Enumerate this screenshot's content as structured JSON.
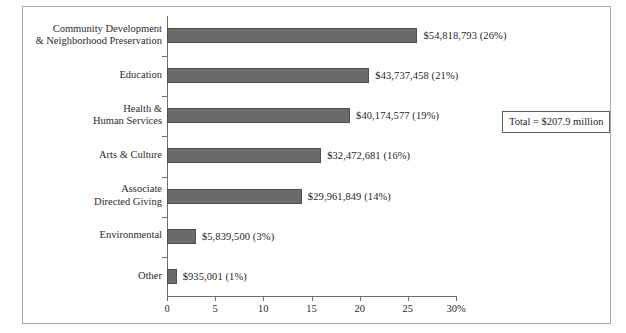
{
  "figure": {
    "frame_border_color": "#a9a9a9",
    "background": "#ffffff",
    "bar_color": "#6b6b6b",
    "axis_color": "#6e6e6e"
  },
  "annotation": {
    "total_label": "Total = $207.9 million"
  },
  "chart_data": {
    "type": "bar",
    "orientation": "horizontal",
    "title": "",
    "xlabel": "",
    "ylabel": "",
    "xlim": [
      0,
      30
    ],
    "xticks": [
      0,
      5,
      10,
      15,
      20,
      25,
      30
    ],
    "xticklabels": [
      "0",
      "5",
      "10",
      "15",
      "20",
      "25",
      "30%"
    ],
    "grid": false,
    "legend": false,
    "categories": [
      "Community Development\n& Neighborhood Preservation",
      "Education",
      "Health &\nHuman Services",
      "Arts & Culture",
      "Associate\nDirected Giving",
      "Environmental",
      "Other"
    ],
    "values": [
      26,
      21,
      19,
      16,
      14,
      3,
      1
    ],
    "amounts": [
      54818793,
      43737458,
      40174577,
      32472681,
      29961849,
      5839500,
      935001
    ],
    "data_labels": [
      "$54,818,793 (26%)",
      "$43,737,458 (21%)",
      "$40,174,577 (19%)",
      "$32,472,681 (16%)",
      "$29,961,849 (14%)",
      "$5,839,500 (3%)",
      "$935,001 (1%)"
    ],
    "total": "$207.9 million"
  }
}
